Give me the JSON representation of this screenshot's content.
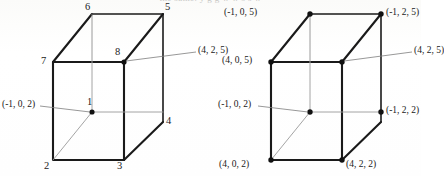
{
  "figure": {
    "cut_off_header_text": "the same. y   g g       w w       s   s   w",
    "background_color": "#fdfdfb",
    "stroke_color": "#1a1a1a",
    "leader_color": "#7d7d7d",
    "hidden_edge_color": "#9a9a9a"
  },
  "left_diagram": {
    "name": "numbered-box",
    "vertex_labels": [
      {
        "id": "v6",
        "text": "6"
      },
      {
        "id": "v5",
        "text": "5"
      },
      {
        "id": "v7",
        "text": "7"
      },
      {
        "id": "v8",
        "text": "8"
      },
      {
        "id": "v4",
        "text": "4"
      },
      {
        "id": "v1",
        "text": "1"
      },
      {
        "id": "v2",
        "text": "2"
      },
      {
        "id": "v3",
        "text": "3"
      }
    ],
    "callouts": [
      {
        "id": "c8",
        "text": "(4, 2, 5)"
      },
      {
        "id": "c1",
        "text": "(-1, 0, 2)"
      }
    ]
  },
  "right_diagram": {
    "name": "coordinate-box",
    "callouts": [
      {
        "id": "top-back-left",
        "text": "(-1, 0, 5)"
      },
      {
        "id": "top-back-right",
        "text": "(-1, 2, 5)"
      },
      {
        "id": "top-front-left",
        "text": "(4, 0, 5)"
      },
      {
        "id": "top-front-right",
        "text": "(4, 2, 5)"
      },
      {
        "id": "bot-back-left",
        "text": "(-1, 0, 2)"
      },
      {
        "id": "bot-back-right",
        "text": "(-1, 2, 2)"
      },
      {
        "id": "bot-front-left",
        "text": "(4, 0, 2)"
      },
      {
        "id": "bot-front-right",
        "text": "(4, 2, 2)"
      }
    ]
  }
}
